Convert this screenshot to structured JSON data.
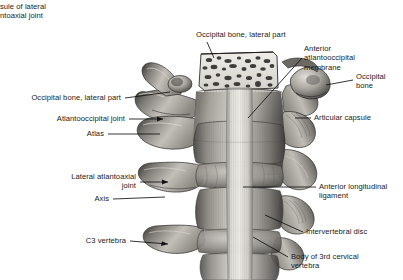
{
  "figure": {
    "background_color": "#ffffff",
    "text_color": "#1a1a1a",
    "width": 403,
    "height": 280
  },
  "labels": {
    "capsule_lateral_atlantoaxial": "sule of lateral\nntoaxial joint",
    "occipital_bone_lateral_part_top": "Occipital bone, lateral part",
    "anterior_atlantooccipital_membrane": "Anterior\natlantooccipital\nmembrane",
    "occipital_bone": "Occipital\nbone",
    "occipital_bone_lateral_part_left": "Occipital bone, lateral part",
    "atlantooccipital_joint": "Atlantooccipital joint",
    "atlas": "Atlas",
    "articular_capsule": "Articular capsule",
    "lateral_atlantoaxial_joint": "Lateral atlantoaxial\njoint",
    "axis": "Axis",
    "c3_vertebra": "C3 vertebra",
    "anterior_longitudinal_ligament": "Anterior longitudinal\nligament",
    "intervertebral_disc": "Intervertebral disc",
    "body_of_3rd_cervical_vertebra": "Body of 3rd cervical\nvertebra"
  },
  "colors": {
    "bone_light": "#d9d7d2",
    "bone_mid": "#a9a6a0",
    "bone_dark": "#6e6b66",
    "bone_shadow": "#3b3936",
    "ligament_light": "#e6e4df",
    "ligament_mid": "#bfbcb6",
    "marrow_bg": "#e8e6e1",
    "marrow_dark": "#2e2c2a",
    "outline": "#2a2826",
    "leader": "#111111"
  }
}
